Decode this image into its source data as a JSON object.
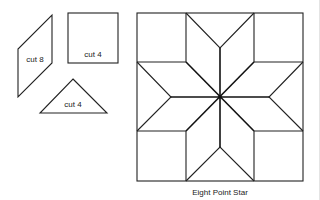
{
  "pieces": [
    {
      "shape": "parallelogram",
      "label": "cut 8"
    },
    {
      "shape": "square",
      "label": "cut 4"
    },
    {
      "shape": "triangle",
      "label": "cut 4"
    }
  ],
  "block": {
    "caption": "Eight Point Star"
  },
  "colors": {
    "stroke": "#222222",
    "background": "#ffffff"
  }
}
